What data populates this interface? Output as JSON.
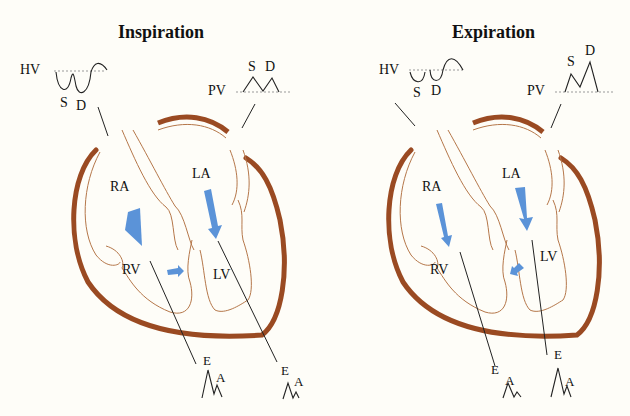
{
  "figure": {
    "colors": {
      "background": "#fefdf8",
      "wall": "#9a4a22",
      "thin_outline": "#b5774a",
      "flow_arrow": "#5b93d8",
      "trace": "#222222",
      "baseline": "#999999"
    },
    "panels": [
      {
        "title": "Inspiration",
        "hepatic_vein": {
          "label": "HV",
          "waves": [
            "S",
            "D"
          ]
        },
        "pulmonary_vein": {
          "label": "PV",
          "waves": [
            "S",
            "D"
          ]
        },
        "chambers": [
          "RA",
          "LA",
          "RV",
          "LV"
        ],
        "tricuspid_inflow": {
          "waves": [
            "E",
            "A"
          ]
        },
        "mitral_inflow": {
          "waves": [
            "E",
            "A"
          ]
        },
        "septal_shift_arrow": "toward-LV"
      },
      {
        "title": "Expiration",
        "hepatic_vein": {
          "label": "HV",
          "waves": [
            "S",
            "D"
          ]
        },
        "pulmonary_vein": {
          "label": "PV",
          "waves": [
            "S",
            "D"
          ]
        },
        "chambers": [
          "RA",
          "LA",
          "RV",
          "LV"
        ],
        "tricuspid_inflow": {
          "waves": [
            "E",
            "A"
          ]
        },
        "mitral_inflow": {
          "waves": [
            "E",
            "A"
          ]
        },
        "septal_shift_arrow": "toward-RV"
      }
    ]
  }
}
